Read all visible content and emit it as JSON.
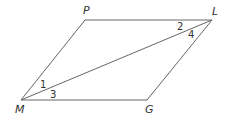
{
  "diagram": {
    "vertices": [
      {
        "id": "P",
        "label": "P",
        "x": 85,
        "y": 20,
        "lx": 83,
        "ly": 14
      },
      {
        "id": "L",
        "label": "L",
        "x": 212,
        "y": 20,
        "lx": 212,
        "ly": 15
      },
      {
        "id": "G",
        "label": "G",
        "x": 147,
        "y": 100,
        "lx": 145,
        "ly": 113
      },
      {
        "id": "M",
        "label": "M",
        "x": 21,
        "y": 100,
        "lx": 15,
        "ly": 113
      }
    ],
    "angles": [
      {
        "label": "1",
        "x": 40,
        "y": 88
      },
      {
        "label": "3",
        "x": 50,
        "y": 98
      },
      {
        "label": "2",
        "x": 177,
        "y": 30
      },
      {
        "label": "4",
        "x": 188,
        "y": 38
      }
    ],
    "colors": {
      "stroke": "#666666",
      "text": "#333333",
      "background": "#ffffff"
    }
  }
}
